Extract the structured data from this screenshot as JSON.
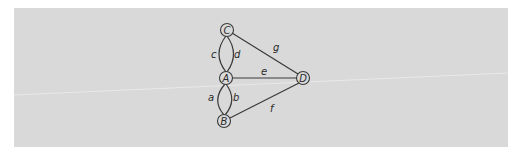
{
  "diagram": {
    "type": "multigraph",
    "nodes": [
      {
        "id": "A",
        "label": "A"
      },
      {
        "id": "B",
        "label": "B"
      },
      {
        "id": "C",
        "label": "C"
      },
      {
        "id": "D",
        "label": "D"
      }
    ],
    "edges": [
      {
        "id": "a",
        "label": "a",
        "from": "A",
        "to": "B"
      },
      {
        "id": "b",
        "label": "b",
        "from": "A",
        "to": "B"
      },
      {
        "id": "c",
        "label": "c",
        "from": "C",
        "to": "A"
      },
      {
        "id": "d",
        "label": "d",
        "from": "C",
        "to": "A"
      },
      {
        "id": "e",
        "label": "e",
        "from": "A",
        "to": "D"
      },
      {
        "id": "f",
        "label": "f",
        "from": "B",
        "to": "D"
      },
      {
        "id": "g",
        "label": "g",
        "from": "C",
        "to": "D"
      }
    ]
  }
}
